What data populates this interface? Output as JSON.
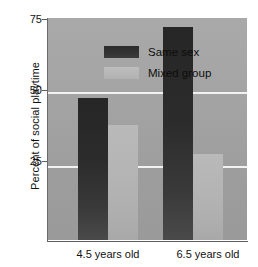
{
  "chart_data": {
    "type": "bar",
    "title": "",
    "subtitle": "",
    "xlabel": "",
    "ylabel": "Percent of social playtime",
    "categories": [
      "4.5 years old",
      "6.5 years old"
    ],
    "series": [
      {
        "name": "Same sex",
        "values": [
          48,
          72
        ],
        "color": "#2e2e2e"
      },
      {
        "name": "Mixed group",
        "values": [
          39,
          29
        ],
        "color": "#b6b6b6"
      }
    ],
    "ylim": [
      0,
      75
    ],
    "yticks": [
      75,
      50,
      25
    ],
    "ytick_labels": [
      "75",
      "50",
      "25"
    ],
    "gridlines": [
      50,
      25
    ],
    "grid": true,
    "grid_color": "#f2f2f2",
    "legend_position": "top-left",
    "plot_background": "#a3a3a3",
    "annotations": []
  },
  "figure": {
    "axis_color": "#5f5f5f",
    "text_color": "#111111"
  }
}
